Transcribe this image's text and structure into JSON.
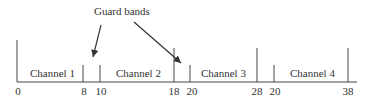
{
  "diagram": {
    "title_annotation": "Guard bands",
    "channels": [
      {
        "label": "Channel 1",
        "start": 0,
        "end": 8
      },
      {
        "label": "Channel 2",
        "start": 10,
        "end": 18
      },
      {
        "label": "Channel 3",
        "start": 20,
        "end": 28
      },
      {
        "label": "Channel 4",
        "start": 20,
        "end": 38
      }
    ],
    "ticks": [
      "0",
      "8",
      "10",
      "18",
      "20",
      "28",
      "20",
      "38"
    ],
    "colors": {
      "line": "#333333",
      "background": "#ffffff"
    }
  }
}
